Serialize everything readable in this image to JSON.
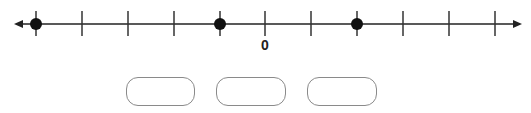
{
  "chart_data": {
    "type": "number_line",
    "ticks": [
      -5,
      -4,
      -3,
      -2,
      -1,
      0,
      1,
      2,
      3,
      4,
      5
    ],
    "labeled_ticks": [
      {
        "value": 0,
        "label": "0"
      }
    ],
    "points": [
      -5,
      -1,
      2
    ],
    "arrows": "both",
    "answer_boxes": 3
  },
  "number_line": {
    "zero_label": "0",
    "tick_x": [
      36,
      82,
      128,
      174,
      220,
      265,
      311,
      357,
      403,
      449,
      495
    ],
    "point_x": [
      36,
      220,
      357
    ]
  },
  "answer_boxes": [
    {
      "value": ""
    },
    {
      "value": ""
    },
    {
      "value": ""
    }
  ]
}
